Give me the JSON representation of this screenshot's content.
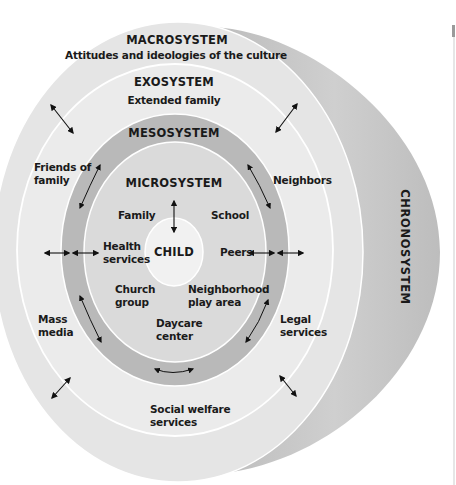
{
  "colors": {
    "macro_fill": "#e6e6e6",
    "exo_fill": "#ececec",
    "meso_fill": "#b8b8b8",
    "micro_fill": "#dcdcdc",
    "child_fill": "#f2f2f2",
    "chrono_fill": "#c4c4c4",
    "ring_stroke": "#ffffff",
    "text": "#1a1a1a"
  },
  "systems": {
    "macrosystem": {
      "title": "MACROSYSTEM",
      "description": "Attitudes and ideologies of the culture"
    },
    "exosystem": {
      "title": "EXOSYSTEM",
      "items": [
        "Extended family",
        "Friends of family",
        "Neighbors",
        "Mass media",
        "Legal services",
        "Social welfare services"
      ]
    },
    "mesosystem": {
      "title": "MESOSYSTEM"
    },
    "microsystem": {
      "title": "MICROSYSTEM",
      "items": [
        "Family",
        "School",
        "Health services",
        "Peers",
        "Church group",
        "Neighborhood play area",
        "Daycare center"
      ]
    },
    "center": {
      "title": "CHILD"
    },
    "chronosystem": {
      "title": "CHRONOSYSTEM"
    }
  },
  "labels": {
    "macro_title": "MACROSYSTEM",
    "macro_desc": "Attitudes and ideologies of the culture",
    "exo_title": "EXOSYSTEM",
    "extended_family": "Extended family",
    "friends_l1": "Friends of",
    "friends_l2": "family",
    "neighbors": "Neighbors",
    "mass_l1": "Mass",
    "mass_l2": "media",
    "legal_l1": "Legal",
    "legal_l2": "services",
    "social_l1": "Social welfare",
    "social_l2": "services",
    "meso_title": "MESOSYSTEM",
    "micro_title": "MICROSYSTEM",
    "family": "Family",
    "school": "School",
    "health_l1": "Health",
    "health_l2": "services",
    "peers": "Peers",
    "church_l1": "Church",
    "church_l2": "group",
    "neighborhood_l1": "Neighborhood",
    "neighborhood_l2": "play area",
    "daycare_l1": "Daycare",
    "daycare_l2": "center",
    "child": "CHILD",
    "chrono_title": "CHRONOSYSTEM"
  }
}
